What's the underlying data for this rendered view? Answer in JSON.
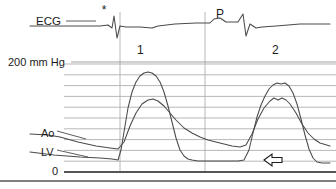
{
  "figure": {
    "type": "hemodynamic-pressure-tracing",
    "title": "",
    "width": 336,
    "height": 189,
    "background": "#ffffff",
    "trace_color": "#4a4a4a",
    "grid_color": "#9a9a9a",
    "axis_color": "#555555",
    "text_color": "#1a1a1a"
  },
  "labels": {
    "ecg": "ECG",
    "pressure_scale": "200 mm Hg",
    "zero": "0",
    "aorta": "Ao",
    "left_ventricle": "LV",
    "beat_one": "1",
    "beat_two": "2",
    "p_wave": "P",
    "asterisk": "*"
  },
  "chart_data": {
    "type": "line",
    "title": "",
    "xlabel": "",
    "ylabel": "Pressure",
    "ylim": [
      0,
      200
    ],
    "yunit": "mm Hg",
    "grid": true,
    "legend": "inline-labels",
    "y_gridlines": [
      0,
      20,
      40,
      60,
      80,
      100,
      120,
      140,
      160,
      180,
      200
    ],
    "gridline_pixel_top": 64,
    "gridline_pixel_bottom": 172,
    "annotations": [
      {
        "name": "beat-1-marker",
        "text": "1",
        "x_px": 137,
        "y_px": 44
      },
      {
        "name": "beat-2-marker",
        "text": "2",
        "x_px": 272,
        "y_px": 44
      },
      {
        "name": "p-wave-marker",
        "text": "P",
        "x_px": 216,
        "y_px": 8
      },
      {
        "name": "asterisk-marker",
        "text": "*",
        "x_px": 104,
        "y_px": 14
      },
      {
        "name": "lvedp-arrow",
        "text": "",
        "x_px": 266,
        "y_px": 160,
        "direction": "left"
      }
    ],
    "vertical_timing_lines_px": [
      120,
      205
    ],
    "series": [
      {
        "name": "ECG",
        "color": "#4a4a4a",
        "points_px": "30,26 92,26 100,26 108,25 112,28 114,16 117,38 120,26 126,27 140,27 152,28 158,26 175,24 196,23 210,23 214,19 220,18 226,22 238,22 243,14 246,36 250,24 256,28 262,27 276,26 300,24 330,24"
      },
      {
        "name": "Ao",
        "color": "#4a4a4a",
        "points_px": "30,134 48,135 60,137 78,142 96,146 110,148 118,149 124,142 130,126 136,113 142,104 148,100 153,99 158,101 164,106 170,113 176,120 184,128 192,133 200,137 208,140 216,142 224,144 232,146 240,147 246,145 252,134 258,119 264,108 270,101 274,98 278,100 282,98 286,100 290,104 296,113 302,124 308,133 314,139 320,143 330,146"
      },
      {
        "name": "LV",
        "color": "#4a4a4a",
        "points_px": "30,152 54,155 80,157 100,158 112,159 118,160 121,150 124,132 128,108 132,92 136,82 140,76 144,73 148,72 152,73 156,76 160,82 164,92 168,106 172,122 176,138 180,150 184,156 188,159 192,160 198,161 206,161 214,161 222,161 230,161 238,161 244,160 249,150 253,133 257,117 261,105 265,96 269,89 273,85 277,83 281,84 285,83 289,86 293,93 297,104 301,119 305,135 309,149 313,158 317,162 322,163 330,163"
      }
    ]
  }
}
